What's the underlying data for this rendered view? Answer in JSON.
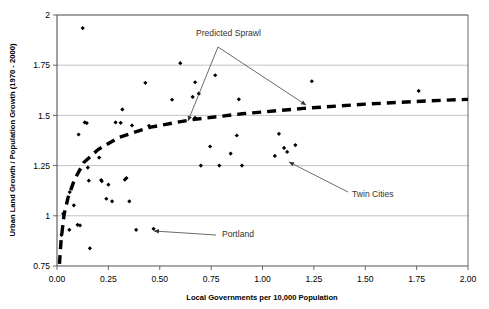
{
  "chart_data": {
    "type": "scatter",
    "title": "",
    "xlabel": "Local Governments per 10,000 Population",
    "ylabel": "Urban Land Growth / Population Growth (1970 - 2000)",
    "xlim": [
      0.0,
      2.0
    ],
    "ylim": [
      0.75,
      2.0
    ],
    "xticks": [
      "0.00",
      "0.25",
      "0.50",
      "0.75",
      "1.00",
      "1.25",
      "1.50",
      "1.75",
      "2.00"
    ],
    "xtick_values": [
      0.0,
      0.25,
      0.5,
      0.75,
      1.0,
      1.25,
      1.5,
      1.75,
      2.0
    ],
    "yticks": [
      "0.75",
      "1",
      "1.25",
      "1.5",
      "1.75",
      "2"
    ],
    "ytick_values": [
      0.75,
      1.0,
      1.25,
      1.5,
      1.75,
      2.0
    ],
    "grid": "horizontal",
    "legend": "none",
    "series": [
      {
        "name": "Metropolitan areas",
        "marker": "diamond",
        "color": "#000000",
        "points": [
          [
            0.125,
            1.935
          ],
          [
            0.135,
            1.465
          ],
          [
            0.145,
            1.462
          ],
          [
            0.15,
            1.24
          ],
          [
            0.155,
            1.175
          ],
          [
            0.16,
            0.838
          ],
          [
            0.105,
            1.405
          ],
          [
            0.1,
            0.955
          ],
          [
            0.112,
            0.952
          ],
          [
            0.082,
            1.052
          ],
          [
            0.062,
            1.118
          ],
          [
            0.06,
            0.93
          ],
          [
            0.03,
            1.01
          ],
          [
            0.022,
            0.905
          ],
          [
            0.205,
            1.29
          ],
          [
            0.215,
            1.178
          ],
          [
            0.218,
            1.172
          ],
          [
            0.24,
            1.085
          ],
          [
            0.268,
            1.072
          ],
          [
            0.25,
            1.155
          ],
          [
            0.285,
            1.465
          ],
          [
            0.31,
            1.463
          ],
          [
            0.318,
            1.53
          ],
          [
            0.33,
            1.18
          ],
          [
            0.338,
            1.188
          ],
          [
            0.352,
            1.072
          ],
          [
            0.365,
            1.45
          ],
          [
            0.385,
            0.93
          ],
          [
            0.43,
            1.662
          ],
          [
            0.448,
            1.448
          ],
          [
            0.47,
            0.935
          ],
          [
            0.56,
            1.578
          ],
          [
            0.6,
            1.76
          ],
          [
            0.66,
            1.592
          ],
          [
            0.672,
            1.665
          ],
          [
            0.69,
            1.608
          ],
          [
            0.672,
            1.488
          ],
          [
            0.7,
            1.25
          ],
          [
            0.745,
            1.345
          ],
          [
            0.77,
            1.7
          ],
          [
            0.79,
            1.25
          ],
          [
            0.845,
            1.31
          ],
          [
            0.875,
            1.4
          ],
          [
            0.885,
            1.58
          ],
          [
            0.9,
            1.25
          ],
          [
            1.06,
            1.298
          ],
          [
            1.08,
            1.408
          ],
          [
            1.105,
            1.338
          ],
          [
            1.12,
            1.318
          ],
          [
            1.16,
            1.352
          ],
          [
            1.24,
            1.67
          ],
          [
            1.76,
            1.622
          ]
        ]
      }
    ],
    "trendline": {
      "name": "Predicted Sprawl",
      "style": "thick dashed",
      "color": "#000000",
      "points": [
        [
          0.012,
          0.76
        ],
        [
          0.02,
          0.88
        ],
        [
          0.035,
          1.01
        ],
        [
          0.055,
          1.095
        ],
        [
          0.085,
          1.18
        ],
        [
          0.13,
          1.265
        ],
        [
          0.2,
          1.33
        ],
        [
          0.3,
          1.39
        ],
        [
          0.45,
          1.44
        ],
        [
          0.65,
          1.478
        ],
        [
          0.9,
          1.508
        ],
        [
          1.2,
          1.535
        ],
        [
          1.5,
          1.556
        ],
        [
          1.8,
          1.572
        ],
        [
          2.0,
          1.58
        ]
      ]
    },
    "annotations": [
      {
        "text": "Predicted Sprawl",
        "label_x": 196,
        "label_y": 36,
        "vertex": [
          218,
          47
        ],
        "arrows": [
          [
            188,
            121
          ],
          [
            306,
            105
          ]
        ]
      },
      {
        "text": "Twin Cities",
        "label_x": 352,
        "label_y": 197,
        "tail": [
          348,
          192
        ],
        "head": [
          289,
          162
        ]
      },
      {
        "text": "Portland",
        "label_x": 222,
        "label_y": 237,
        "tail": [
          216,
          235
        ],
        "head": [
          154,
          231
        ]
      }
    ]
  }
}
